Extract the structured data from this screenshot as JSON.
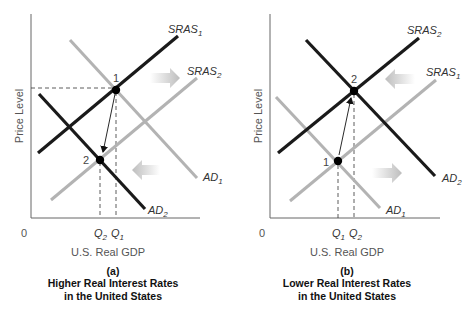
{
  "panels": [
    {
      "id": "a",
      "letter": "(a)",
      "caption_line1": "Higher Real Interest Rates",
      "caption_line2": "in the United States",
      "y_axis_label": "Price Level",
      "x_axis_label": "U.S. Real GDP",
      "origin_label": "0",
      "q_labels": [
        {
          "base": "Q",
          "sub": "2"
        },
        {
          "base": "Q",
          "sub": "1"
        }
      ],
      "curves": [
        {
          "name": "SRAS",
          "sub": "1",
          "color": "#1a1a1a"
        },
        {
          "name": "SRAS",
          "sub": "2",
          "color": "#b3b3b3"
        },
        {
          "name": "AD",
          "sub": "1",
          "color": "#b3b3b3"
        },
        {
          "name": "AD",
          "sub": "2",
          "color": "#1a1a1a"
        }
      ],
      "points": [
        "1",
        "2"
      ],
      "shift_arrows": [
        "right",
        "left"
      ]
    },
    {
      "id": "b",
      "letter": "(b)",
      "caption_line1": "Lower Real Interest Rates",
      "caption_line2": "in the United States",
      "y_axis_label": "Price Level",
      "x_axis_label": "U.S. Real GDP",
      "origin_label": "0",
      "q_labels": [
        {
          "base": "Q",
          "sub": "1"
        },
        {
          "base": "Q",
          "sub": "2"
        }
      ],
      "curves": [
        {
          "name": "SRAS",
          "sub": "2",
          "color": "#1a1a1a"
        },
        {
          "name": "SRAS",
          "sub": "1",
          "color": "#b3b3b3"
        },
        {
          "name": "AD",
          "sub": "2",
          "color": "#1a1a1a"
        },
        {
          "name": "AD",
          "sub": "1",
          "color": "#b3b3b3"
        }
      ],
      "points": [
        "2",
        "1"
      ],
      "shift_arrows": [
        "left",
        "right"
      ]
    }
  ],
  "colors": {
    "new_curve": "#1a1a1a",
    "old_curve": "#b3b3b3",
    "axis": "#666666",
    "shift_arrow": "#c8c8c8"
  }
}
